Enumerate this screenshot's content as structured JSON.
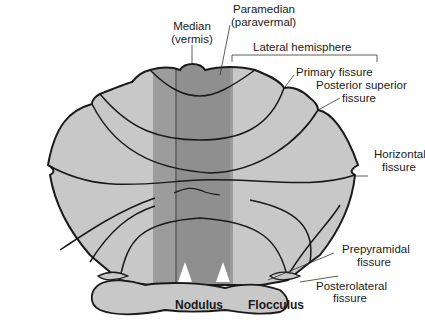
{
  "diagram": {
    "colors": {
      "hemisphere": "#c8c8c8",
      "paramedian": "#9a9a9a",
      "vermis": "#8e8e8e",
      "outline": "#1a1a1a",
      "background": "#ffffff"
    },
    "labels": {
      "median_line1": "Median",
      "median_line2": "(vermis)",
      "paramedian_line1": "Paramedian",
      "paramedian_line2": "(paravermal)",
      "lateral": "Lateral hemisphere",
      "primary": "Primary fissure",
      "post_sup_line1": "Posterior superior",
      "post_sup_line2": "fissure",
      "horizontal_line1": "Horizontal",
      "horizontal_line2": "fissure",
      "prepyramidal_line1": "Prepyramidal",
      "prepyramidal_line2": "fissure",
      "posterolateral_line1": "Posterolateral",
      "posterolateral_line2": "fissure",
      "nodulus": "Nodulus",
      "flocculus": "Flocculus"
    }
  }
}
